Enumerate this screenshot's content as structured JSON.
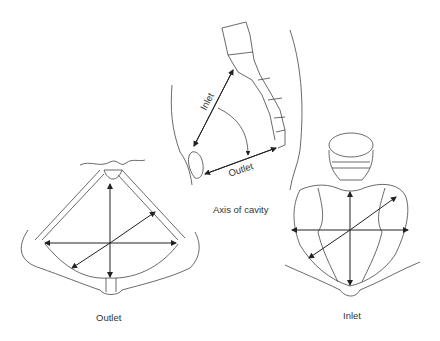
{
  "figure": {
    "sagittal_view": {
      "inlet_label": "Inlet",
      "outlet_label": "Outlet",
      "caption": "Axis of cavity"
    },
    "outlet_view": {
      "caption": "Outlet"
    },
    "inlet_view": {
      "caption": "Inlet"
    }
  },
  "colors": {
    "line": "#333333",
    "background": "#ffffff"
  }
}
